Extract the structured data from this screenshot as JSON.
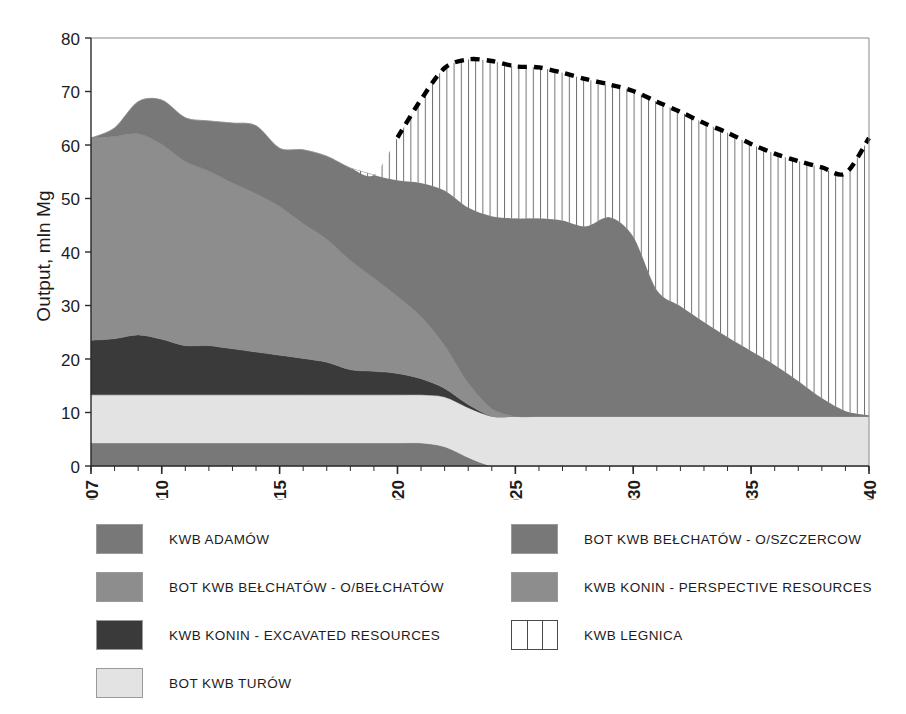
{
  "chart_data": {
    "type": "area",
    "stacked": true,
    "title": "",
    "subtitle": "",
    "xlabel": "",
    "ylabel": "Output, mln Mg",
    "xlim": [
      2007,
      2040
    ],
    "ylim": [
      0,
      80
    ],
    "y_ticks": [
      0,
      10,
      20,
      30,
      40,
      50,
      60,
      70,
      80
    ],
    "x_ticks": [
      2007,
      2010,
      2015,
      2020,
      2025,
      2030,
      2035,
      2040
    ],
    "x_tick_labels": [
      "2007",
      "2010",
      "2015",
      "2020",
      "2025",
      "2030",
      "2035",
      "2040"
    ],
    "x_minor_tick_step": 1,
    "grid": false,
    "legend_position": "below-two-columns",
    "x": [
      2007,
      2008,
      2009,
      2010,
      2011,
      2012,
      2013,
      2014,
      2015,
      2016,
      2017,
      2018,
      2019,
      2020,
      2021,
      2022,
      2023,
      2024,
      2025,
      2026,
      2027,
      2028,
      2029,
      2030,
      2031,
      2032,
      2033,
      2034,
      2035,
      2036,
      2037,
      2038,
      2039,
      2040
    ],
    "series": [
      {
        "name": "KWB ADAMÓW",
        "color": "#787878",
        "stack_order": 1,
        "values": [
          4.3,
          4.3,
          4.3,
          4.3,
          4.3,
          4.3,
          4.3,
          4.3,
          4.3,
          4.3,
          4.3,
          4.3,
          4.3,
          4.3,
          4.3,
          3.6,
          1.6,
          0,
          0,
          0,
          0,
          0,
          0,
          0,
          0,
          0,
          0,
          0,
          0,
          0,
          0,
          0,
          0,
          0
        ]
      },
      {
        "name": "BOT KWB TURÓW",
        "color": "#e3e3e3",
        "stack_order": 2,
        "values": [
          9.0,
          9.0,
          9.0,
          9.0,
          9.0,
          9.0,
          9.0,
          9.0,
          9.0,
          9.0,
          9.0,
          9.0,
          9.0,
          9.0,
          9.0,
          9.3,
          9.3,
          9.3,
          9.3,
          9.3,
          9.3,
          9.3,
          9.3,
          9.3,
          9.3,
          9.3,
          9.3,
          9.3,
          9.3,
          9.3,
          9.3,
          9.3,
          9.3,
          9.3
        ]
      },
      {
        "name": "KWB KONIN - EXCAVATED RESOURCES",
        "color": "#3a3a3a",
        "stack_order": 3,
        "values": [
          10.2,
          10.5,
          11.2,
          10.4,
          9.2,
          9.2,
          8.6,
          8.0,
          7.4,
          6.8,
          6.1,
          4.7,
          4.4,
          4.0,
          3.0,
          1.6,
          0.6,
          0,
          0,
          0,
          0,
          0,
          0,
          0,
          0,
          0,
          0,
          0,
          0,
          0,
          0,
          0,
          0,
          0
        ]
      },
      {
        "name": "BOT KWB BEŁCHATÓW - O/BEŁCHATÓW",
        "color": "#8d8d8d",
        "stack_order": 4,
        "values": [
          37.8,
          37.8,
          37.6,
          36.4,
          34.4,
          32.6,
          31.0,
          29.6,
          27.8,
          25.2,
          23.0,
          20.4,
          17.4,
          14.4,
          11.6,
          8.0,
          4.0,
          1.4,
          0,
          0,
          0,
          0,
          0,
          0,
          0,
          0,
          0,
          0,
          0,
          0,
          0,
          0,
          0,
          0
        ]
      },
      {
        "name": "BOT KWB BEŁCHATÓW - O/SZCZERCOW",
        "color": "#787878",
        "stack_order": 5,
        "values": [
          0,
          1.6,
          6.0,
          8.3,
          8.2,
          9.4,
          11.2,
          12.7,
          10.9,
          13.8,
          15.5,
          17.3,
          19.3,
          21.7,
          25.0,
          29.0,
          32.8,
          36.0,
          37.0,
          37.0,
          36.6,
          35.5,
          37.2,
          33.6,
          23.6,
          20.6,
          17.6,
          14.8,
          12.2,
          9.6,
          6.6,
          3.4,
          1.0,
          0.2
        ]
      },
      {
        "name": "KWB KONIN - PERSPECTIVE RESOURCES",
        "color": "#8d8d8d",
        "stack_order": 6,
        "values": [
          0,
          0,
          0,
          0,
          0,
          0,
          0,
          0,
          0,
          0,
          0,
          0,
          0,
          0,
          0,
          0,
          0,
          0,
          0,
          0,
          0,
          0,
          0,
          0,
          0,
          0,
          0,
          0,
          0,
          0,
          0,
          0,
          0,
          0
        ]
      },
      {
        "name": "KWB LEGNICA",
        "color": "#ffffff",
        "pattern": "vertical-hatch",
        "outline": "dashed-black",
        "stack_order": 7,
        "values": [
          0,
          0,
          0,
          0,
          0,
          0,
          0,
          0,
          0,
          0,
          0,
          0,
          0,
          8.0,
          15.6,
          22.9,
          27.7,
          29.0,
          28.4,
          28.2,
          27.6,
          27.5,
          24.8,
          27.2,
          35.2,
          36.3,
          37.2,
          38.2,
          38.7,
          39.5,
          41.1,
          43.1,
          44.4,
          51.8
        ]
      }
    ],
    "totals_without_legnica": [
      61.3,
      63.2,
      68.1,
      68.4,
      65.1,
      64.5,
      64.1,
      63.6,
      59.4,
      59.1,
      57.9,
      55.7,
      54.4,
      53.4,
      52.9,
      51.5,
      48.3,
      46.7,
      46.3,
      46.3,
      45.9,
      44.8,
      46.5,
      42.9,
      32.9,
      29.9,
      26.9,
      24.1,
      21.5,
      18.9,
      15.9,
      12.7,
      10.3,
      9.5
    ],
    "dashed_line": {
      "name": "Total output with KWB LEGNICA",
      "style": "dashed",
      "color": "#000000",
      "x": [
        2020,
        2021,
        2022,
        2023,
        2024,
        2025,
        2026,
        2027,
        2028,
        2029,
        2030,
        2031,
        2032,
        2033,
        2034,
        2035,
        2036,
        2037,
        2038,
        2039,
        2040
      ],
      "values": [
        61.4,
        68.5,
        74.4,
        76.0,
        75.7,
        74.7,
        74.5,
        73.5,
        72.3,
        71.3,
        70.1,
        68.1,
        66.2,
        64.1,
        62.3,
        60.2,
        58.4,
        57.0,
        55.8,
        54.7,
        61.3
      ]
    }
  },
  "axes": {
    "y_title": "Output, mln Mg",
    "y_tick_labels": [
      "0",
      "10",
      "20",
      "30",
      "40",
      "50",
      "60",
      "70",
      "80"
    ],
    "x_tick_labels": [
      "2007",
      "2010",
      "2015",
      "2020",
      "2025",
      "2030",
      "2035",
      "2040"
    ]
  },
  "legend": {
    "left_column": [
      {
        "label": "KWB ADAMÓW",
        "color": "#787878",
        "pattern": "solid"
      },
      {
        "label": "BOT KWB BEŁCHATÓW - O/BEŁCHATÓW",
        "color": "#8d8d8d",
        "pattern": "solid"
      },
      {
        "label": "KWB KONIN - EXCAVATED RESOURCES",
        "color": "#3a3a3a",
        "pattern": "solid"
      },
      {
        "label": "BOT KWB TURÓW",
        "color": "#e3e3e3",
        "pattern": "solid"
      }
    ],
    "right_column": [
      {
        "label": "BOT KWB BEŁCHATÓW - O/SZCZERCOW",
        "color": "#787878",
        "pattern": "solid"
      },
      {
        "label": "KWB KONIN - PERSPECTIVE RESOURCES",
        "color": "#8d8d8d",
        "pattern": "solid"
      },
      {
        "label": "KWB LEGNICA",
        "color": "#ffffff",
        "pattern": "vertical-hatch"
      }
    ]
  }
}
